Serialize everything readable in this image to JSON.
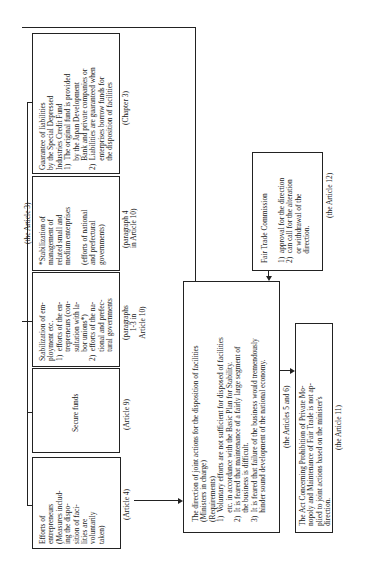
{
  "diagram": {
    "orientation": "rotated 90 degrees counterclockwise",
    "group_label": "(the Article 3)",
    "boxes": {
      "guarantee": {
        "text": "Guarantee of liabilities\nby the Special Depressed\nIndustries Credit Fund\n1)  The original fund is provided\n     by the Japan Development\n     Bank and private companies or\n2)  Liabilities are guaranteed when\n     enterprises borrow funds for\n     the disposition of facilities",
        "ref": "(Chapter 3)"
      },
      "stabilization_management": {
        "text": "*Stabilization of\nmanagement of\nrelated small and\nmedium enterprises\n\n(efforts of national\nand prefectural\ngovernments)",
        "ref": "(paragraph 4\nin Article 10)"
      },
      "stabilization_employment": {
        "text": "Stabilization of em-\nployment etc.\n1)  efforts of the en-\n     trepreneurs (con-\n     sultation with la-\n     bor unions*)\n2)  efforts of the na-\n     tional and prefec-\n     tural governments",
        "ref": "(paragraphs\n1-3 in\nArticle 10)"
      },
      "secure_funds": {
        "text": "Secure funds",
        "ref": "(Article 9)"
      },
      "efforts_entrepreneurs": {
        "text": "Efforts of\nentrepreneurs\n(Measures includ-\ning the dispo-\nsition of faci-\nlities are\nvoluntarily\ntaken)",
        "ref": "(Article 4)"
      },
      "direction": {
        "text": "The direction of joint actions for the disposition of facilities\n(Ministers in charge)\n(Requirements)\n1)  Voluntary efforts are not sufficient for disposed of facilities\n     etc. in accordance with the Basic Plan for Stability.\n2)  It is feared that maintenance of a fairly large segment of\n     the business is difficult.\n3)  It is feared that failure of the business would tremendously\n     hinder sound development of the national economy.",
        "ref": "(the Articles 5 and 6)"
      },
      "fair_trade": {
        "text": "Fair Trade Commission\n\n1)  approval for the direction\n2)  can call for the alteration\n     or withdrawal of the\n     direction.",
        "ref": "(the Article 12)"
      },
      "act": {
        "text": "The Act Concerning Prohibition of Private Mo-\nnopoly and Maintenance of Fair Trade is not ap-\nplied to joint actions based on the minister's\ndirection.",
        "ref": "(the Article 11)"
      }
    }
  }
}
